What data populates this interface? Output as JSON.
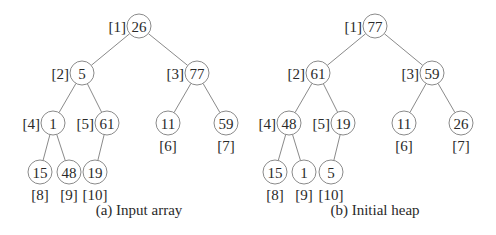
{
  "figures": [
    {
      "id": "a",
      "caption": "(a) Input array",
      "caption_pos": [
        139,
        215
      ],
      "nodes": [
        {
          "index": "[1]",
          "value": "26",
          "x": 139,
          "y": 26,
          "label_side": "left"
        },
        {
          "index": "[2]",
          "value": "5",
          "x": 82,
          "y": 73,
          "label_side": "left"
        },
        {
          "index": "[3]",
          "value": "77",
          "x": 197,
          "y": 73,
          "label_side": "left"
        },
        {
          "index": "[4]",
          "value": "1",
          "x": 53,
          "y": 123,
          "label_side": "left"
        },
        {
          "index": "[5]",
          "value": "61",
          "x": 107,
          "y": 123,
          "label_side": "left"
        },
        {
          "index": "[6]",
          "value": "11",
          "x": 168,
          "y": 123,
          "label_side": "below"
        },
        {
          "index": "[7]",
          "value": "59",
          "x": 226,
          "y": 123,
          "label_side": "below"
        },
        {
          "index": "[8]",
          "value": "15",
          "x": 40,
          "y": 172,
          "label_side": "below"
        },
        {
          "index": "[9]",
          "value": "48",
          "x": 69,
          "y": 172,
          "label_side": "below"
        },
        {
          "index": "[10]",
          "value": "19",
          "x": 95,
          "y": 172,
          "label_side": "below"
        }
      ]
    },
    {
      "id": "b",
      "caption": "(b) Initial heap",
      "caption_pos": [
        375,
        215
      ],
      "nodes": [
        {
          "index": "[1]",
          "value": "77",
          "x": 375,
          "y": 26,
          "label_side": "left"
        },
        {
          "index": "[2]",
          "value": "61",
          "x": 318,
          "y": 73,
          "label_side": "left"
        },
        {
          "index": "[3]",
          "value": "59",
          "x": 432,
          "y": 73,
          "label_side": "left"
        },
        {
          "index": "[4]",
          "value": "48",
          "x": 289,
          "y": 123,
          "label_side": "left"
        },
        {
          "index": "[5]",
          "value": "19",
          "x": 343,
          "y": 123,
          "label_side": "left"
        },
        {
          "index": "[6]",
          "value": "11",
          "x": 404,
          "y": 123,
          "label_side": "below"
        },
        {
          "index": "[7]",
          "value": "26",
          "x": 461,
          "y": 123,
          "label_side": "below"
        },
        {
          "index": "[8]",
          "value": "15",
          "x": 275,
          "y": 172,
          "label_side": "below"
        },
        {
          "index": "[9]",
          "value": "1",
          "x": 304,
          "y": 172,
          "label_side": "below"
        },
        {
          "index": "[10]",
          "value": "5",
          "x": 331,
          "y": 172,
          "label_side": "below"
        }
      ]
    }
  ],
  "edges": [
    [
      1,
      2
    ],
    [
      1,
      3
    ],
    [
      2,
      4
    ],
    [
      2,
      5
    ],
    [
      3,
      6
    ],
    [
      3,
      7
    ],
    [
      4,
      8
    ],
    [
      4,
      9
    ],
    [
      5,
      10
    ]
  ],
  "node_radius": 12,
  "colors": {
    "stroke": "#8a8a8a",
    "text": "#2a2a2a",
    "background": "#ffffff"
  }
}
